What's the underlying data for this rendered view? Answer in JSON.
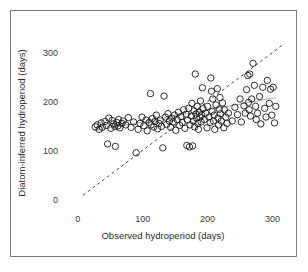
{
  "figure": {
    "border_color": "#7b7b7b",
    "background": "#ffffff"
  },
  "chart_data": {
    "type": "scatter",
    "title": "",
    "xlabel": "Observed hydroperiod (days)",
    "ylabel": "Diatom-inferred hydroperiod (days)",
    "xlim": [
      -15,
      330
    ],
    "ylim": [
      -18,
      340
    ],
    "xticks": [
      0,
      100,
      200,
      300
    ],
    "xtick_labels": [
      "0",
      "100",
      "200",
      "300"
    ],
    "yticks": [
      0,
      100,
      200,
      300
    ],
    "ytick_labels": [
      "0",
      "100",
      "200",
      "300"
    ],
    "grid": false,
    "legend": "none",
    "marker": {
      "shape": "open-circle",
      "radius_px": 3.2,
      "stroke": "#1a1a1a",
      "fill": "none"
    },
    "annotations": [
      {
        "name": "one-to-one-line",
        "type": "line",
        "style": "dashed",
        "color": "#4a4a4a",
        "x": [
          8,
          318
        ],
        "y": [
          8,
          318
        ],
        "description": "1:1 reference line"
      },
      {
        "name": "regression-line",
        "type": "line",
        "style": "solid",
        "color": "#8a8a8a",
        "x": [
          25,
          305
        ],
        "y": [
          140,
          208
        ],
        "description": "least-squares fit through data"
      }
    ],
    "series": [
      {
        "name": "sites",
        "points": [
          [
            27,
            148
          ],
          [
            30,
            152
          ],
          [
            33,
            143
          ],
          [
            36,
            156
          ],
          [
            38,
            147
          ],
          [
            42,
            159
          ],
          [
            44,
            151
          ],
          [
            46,
            113
          ],
          [
            48,
            166
          ],
          [
            51,
            145
          ],
          [
            53,
            161
          ],
          [
            55,
            154
          ],
          [
            57,
            149
          ],
          [
            58,
            108
          ],
          [
            60,
            157
          ],
          [
            62,
            150
          ],
          [
            63,
            163
          ],
          [
            65,
            146
          ],
          [
            68,
            155
          ],
          [
            70,
            160
          ],
          [
            74,
            152
          ],
          [
            78,
            167
          ],
          [
            82,
            147
          ],
          [
            86,
            158
          ],
          [
            90,
            95
          ],
          [
            93,
            143
          ],
          [
            96,
            155
          ],
          [
            99,
            168
          ],
          [
            102,
            150
          ],
          [
            105,
            162
          ],
          [
            107,
            140
          ],
          [
            110,
            157
          ],
          [
            112,
            216
          ],
          [
            113,
            152
          ],
          [
            115,
            165
          ],
          [
            117,
            148
          ],
          [
            119,
            159
          ],
          [
            121,
            172
          ],
          [
            123,
            144
          ],
          [
            125,
            155
          ],
          [
            127,
            162
          ],
          [
            129,
            149
          ],
          [
            131,
            105
          ],
          [
            133,
            211
          ],
          [
            135,
            168
          ],
          [
            137,
            153
          ],
          [
            139,
            175
          ],
          [
            141,
            160
          ],
          [
            143,
            147
          ],
          [
            145,
            166
          ],
          [
            147,
            158
          ],
          [
            149,
            172
          ],
          [
            151,
            141
          ],
          [
            153,
            163
          ],
          [
            155,
            178
          ],
          [
            157,
            151
          ],
          [
            159,
            169
          ],
          [
            161,
            157
          ],
          [
            163,
            183
          ],
          [
            165,
            145
          ],
          [
            167,
            174
          ],
          [
            168,
            110
          ],
          [
            169,
            162
          ],
          [
            171,
            186
          ],
          [
            172,
            107
          ],
          [
            173,
            152
          ],
          [
            175,
            170
          ],
          [
            176,
            196
          ],
          [
            177,
            109
          ],
          [
            178,
            160
          ],
          [
            179,
            181
          ],
          [
            180,
            148
          ],
          [
            181,
            256
          ],
          [
            182,
            174
          ],
          [
            183,
            166
          ],
          [
            184,
            190
          ],
          [
            185,
            155
          ],
          [
            186,
            143
          ],
          [
            187,
            178
          ],
          [
            188,
            168
          ],
          [
            189,
            201
          ],
          [
            190,
            158
          ],
          [
            191,
            172
          ],
          [
            192,
            228
          ],
          [
            193,
            185
          ],
          [
            195,
            163
          ],
          [
            197,
            176
          ],
          [
            199,
            146
          ],
          [
            200,
            190
          ],
          [
            202,
            168
          ],
          [
            204,
            157
          ],
          [
            205,
            248
          ],
          [
            206,
            221
          ],
          [
            207,
            180
          ],
          [
            208,
            205
          ],
          [
            209,
            160
          ],
          [
            210,
            172
          ],
          [
            211,
            143
          ],
          [
            213,
            193
          ],
          [
            215,
            226
          ],
          [
            216,
            166
          ],
          [
            217,
            152
          ],
          [
            218,
            184
          ],
          [
            219,
            208
          ],
          [
            220,
            175
          ],
          [
            221,
            160
          ],
          [
            223,
            197
          ],
          [
            225,
            146
          ],
          [
            226,
            183
          ],
          [
            228,
            168
          ],
          [
            230,
            155
          ],
          [
            232,
            176
          ],
          [
            238,
            160
          ],
          [
            242,
            188
          ],
          [
            246,
            173
          ],
          [
            250,
            205
          ],
          [
            252,
            158
          ],
          [
            256,
            191
          ],
          [
            258,
            176
          ],
          [
            260,
            224
          ],
          [
            262,
            253
          ],
          [
            263,
            198
          ],
          [
            264,
            183
          ],
          [
            265,
            256
          ],
          [
            266,
            170
          ],
          [
            268,
            205
          ],
          [
            270,
            278
          ],
          [
            272,
            233
          ],
          [
            274,
            190
          ],
          [
            275,
            163
          ],
          [
            277,
            176
          ],
          [
            280,
            210
          ],
          [
            282,
            154
          ],
          [
            285,
            229
          ],
          [
            288,
            186
          ],
          [
            290,
            168
          ],
          [
            292,
            243
          ],
          [
            295,
            196
          ],
          [
            297,
            225
          ],
          [
            299,
            172
          ],
          [
            301,
            229
          ],
          [
            303,
            156
          ],
          [
            305,
            190
          ]
        ]
      }
    ]
  }
}
